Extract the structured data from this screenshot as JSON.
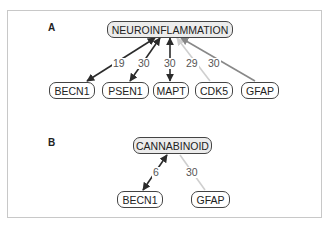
{
  "panels": [
    {
      "label": "A",
      "hub": "NEUROINFLAMMATION",
      "nodes": [
        "BECN1",
        "PSEN1",
        "MAPT",
        "CDK5",
        "GFAP"
      ],
      "edges": [
        {
          "from": "BECN1",
          "to": "NEUROINFLAMMATION",
          "weight": "19",
          "color": "#2b2b2b",
          "direction": "both"
        },
        {
          "from": "PSEN1",
          "to": "NEUROINFLAMMATION",
          "weight": "30",
          "color": "#2b2b2b",
          "direction": "both"
        },
        {
          "from": "MAPT",
          "to": "NEUROINFLAMMATION",
          "weight": "30",
          "color": "#2b2b2b",
          "direction": "both"
        },
        {
          "from": "CDK5",
          "to": "NEUROINFLAMMATION",
          "weight": "29",
          "color": "#cfcfcf",
          "direction": "to-hub"
        },
        {
          "from": "GFAP",
          "to": "NEUROINFLAMMATION",
          "weight": "30",
          "color": "#888888",
          "direction": "to-hub"
        }
      ]
    },
    {
      "label": "B",
      "hub": "CANNABINOID",
      "nodes": [
        "BECN1",
        "GFAP"
      ],
      "edges": [
        {
          "from": "BECN1",
          "to": "CANNABINOID",
          "weight": "6",
          "color": "#2b2b2b",
          "direction": "both"
        },
        {
          "from": "GFAP",
          "to": "CANNABINOID",
          "weight": "30",
          "color": "#cfcfcf",
          "direction": "none"
        }
      ]
    }
  ]
}
